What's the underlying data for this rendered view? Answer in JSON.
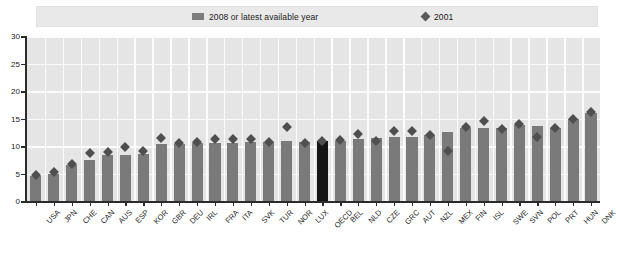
{
  "legend": {
    "items": [
      {
        "name": "bar-series",
        "label": "2008 or latest available year",
        "marker": "bar-swatch-icon",
        "color": "#7a7a7a"
      },
      {
        "name": "diamond-series",
        "label": "2001",
        "marker": "diamond-marker-icon",
        "color": "#4f4f4f"
      }
    ]
  },
  "axes": {
    "y_ticks": [
      "30",
      "25",
      "20",
      "15",
      "10",
      "5",
      "0"
    ],
    "y_min": 0,
    "y_max": 30
  },
  "colors": {
    "bar": "#7a7a7a",
    "bar_highlight": "#141414",
    "diamond": "#4f4f4f",
    "plot_background": "#e5e5e5",
    "gridline": "#fbfbfb",
    "axis": "#2b2b2b",
    "legend_background": "#e9e9e9"
  },
  "chart_data": {
    "type": "bar",
    "title": "",
    "xlabel": "",
    "ylabel": "",
    "ylim": [
      0,
      30
    ],
    "yticks": [
      0,
      5,
      10,
      15,
      20,
      25,
      30
    ],
    "grid": true,
    "legend_position": "top",
    "highlight_category": "OECD",
    "categories": [
      "USA",
      "JPN",
      "CHE",
      "CAN",
      "AUS",
      "ESP",
      "KOR",
      "GBR",
      "DEU",
      "IRL",
      "FRA",
      "ITA",
      "SVK",
      "TUR",
      "NOR",
      "LUX",
      "OECD",
      "BEL",
      "NLD",
      "CZE",
      "GRC",
      "AUT",
      "NZL",
      "MEX",
      "FIN",
      "ISL",
      "SWE",
      "SVN",
      "POL",
      "PRT",
      "HUN",
      "DNK"
    ],
    "series": [
      {
        "name": "2008 or latest available year",
        "type": "bar",
        "values": [
          4.6,
          5.0,
          6.5,
          7.5,
          8.3,
          8.4,
          8.5,
          10.3,
          10.4,
          10.5,
          10.6,
          10.6,
          10.8,
          10.7,
          10.9,
          10.8,
          11.0,
          11.0,
          11.3,
          11.4,
          11.6,
          11.7,
          12.0,
          12.6,
          13.3,
          13.2,
          13.3,
          13.9,
          13.6,
          13.3,
          15.0,
          16.0
        ]
      },
      {
        "name": "2001",
        "type": "scatter",
        "values": [
          4.7,
          5.2,
          6.8,
          8.8,
          9.0,
          9.8,
          9.1,
          11.4,
          10.5,
          10.7,
          11.2,
          11.3,
          11.3,
          10.7,
          13.5,
          10.6,
          11.0,
          11.1,
          12.1,
          11.0,
          12.8,
          12.7,
          12.0,
          9.1,
          13.4,
          14.5,
          13.1,
          14.0,
          11.7,
          13.3,
          15.0,
          16.1
        ]
      }
    ]
  }
}
